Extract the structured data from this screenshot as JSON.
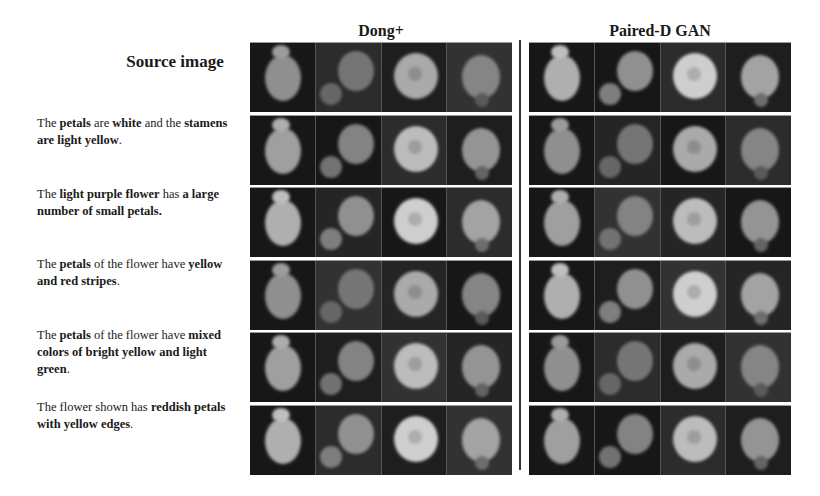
{
  "figure": {
    "column_titles": {
      "source": "Source image",
      "method_1": "Dong+",
      "method_2": "Paired-D GAN"
    },
    "rows": [
      {
        "type": "source",
        "caption": null
      },
      {
        "type": "text",
        "caption_parts": [
          {
            "t": "The ",
            "b": false
          },
          {
            "t": "petals",
            "b": true
          },
          {
            "t": " are ",
            "b": false
          },
          {
            "t": "white",
            "b": true
          },
          {
            "t": " and the ",
            "b": false
          },
          {
            "t": "stamens are light yellow",
            "b": true
          },
          {
            "t": ".",
            "b": false
          }
        ]
      },
      {
        "type": "text",
        "caption_parts": [
          {
            "t": "The ",
            "b": false
          },
          {
            "t": "light purple flower",
            "b": true
          },
          {
            "t": " has ",
            "b": false
          },
          {
            "t": "a large number of small petals.",
            "b": true
          }
        ]
      },
      {
        "type": "text",
        "caption_parts": [
          {
            "t": "The ",
            "b": false
          },
          {
            "t": "petals",
            "b": true
          },
          {
            "t": " of the flower have ",
            "b": false
          },
          {
            "t": "yellow and red stripes",
            "b": true
          },
          {
            "t": ".",
            "b": false
          }
        ]
      },
      {
        "type": "text",
        "caption_parts": [
          {
            "t": "The ",
            "b": false
          },
          {
            "t": "petals",
            "b": true
          },
          {
            "t": " of the flower have ",
            "b": false
          },
          {
            "t": "mixed colors of bright yellow and light green",
            "b": true
          },
          {
            "t": ".",
            "b": false
          }
        ]
      },
      {
        "type": "text",
        "caption_parts": [
          {
            "t": "The flower shown has ",
            "b": false
          },
          {
            "t": "reddish petals with yellow edges",
            "b": true
          },
          {
            "t": ".",
            "b": false
          }
        ]
      }
    ],
    "images_per_row": 4,
    "colors": {
      "background": "#ffffff",
      "divider": "#333333",
      "image_bg": "#2a2a2a"
    }
  }
}
